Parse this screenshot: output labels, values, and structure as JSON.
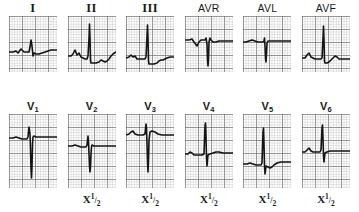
{
  "figure": {
    "grid": {
      "minor_color": "#a8a8a8",
      "major_color": "#5a5a5a",
      "minor_step_px": 2.6,
      "major_every": 5,
      "background": "#ffffff"
    },
    "trace_color": "#141414"
  },
  "rows": [
    {
      "name": "limb-leads",
      "panels": [
        {
          "lead": "I",
          "label_style": "roman",
          "scale": "",
          "box": {
            "w": 48,
            "h": 56
          },
          "baseline": 36,
          "trace": "M0,36 L4,36 L7,35 L9,37 L12,33 L15,36 L17,36 L20,36 L21,31 L22,24 L23,30 L24,40 L25,37 L27,38 L30,38 L33,37 L36,36 L39,35 L42,34 L45,34 L48,34"
        },
        {
          "lead": "II",
          "label_style": "roman",
          "scale": "",
          "box": {
            "w": 48,
            "h": 56
          },
          "baseline": 40,
          "trace": "M0,40 L3,40 L5,38 L7,34 L9,39 L11,37 L13,41 L15,42 L17,43 L19,43 L20,40 L21,22 L21.5,8 L22,22 L22.5,44 L23,47 L25,47 L28,47 L31,46 L33,44 L35,45 L37,46 L39,45 L41,43 L43,40 L45,38 L48,36"
        },
        {
          "lead": "III",
          "label_style": "roman",
          "scale": "",
          "box": {
            "w": 48,
            "h": 56
          },
          "baseline": 42,
          "trace": "M0,42 L3,41 L5,39 L7,41 L9,40 L11,43 L13,43 L15,43 L17,43 L19,43 L20,41 L21,20 L21.5,9 L22,22 L22.5,45 L23,48 L25,48 L28,48 L31,47 L33,45 L35,44 L37,44 L39,43 L41,42 L44,41 L48,41"
        },
        {
          "lead": "AVR",
          "label_style": "avx",
          "scale": "",
          "box": {
            "w": 48,
            "h": 56
          },
          "baseline": 24,
          "trace": "M0,24 L4,24 L7,23 L9,26 L12,30 L14,26 L16,24 L18,24 L20,24 L21,22 L22,28 L22.5,44 L23,50 L23.5,44 L24,26 L25,22 L26,24 L28,26 L31,26 L34,25 L37,25 L40,25 L44,25 L48,25"
        },
        {
          "lead": "AVL",
          "label_style": "avx",
          "scale": "",
          "box": {
            "w": 48,
            "h": 56
          },
          "baseline": 26,
          "trace": "M0,26 L3,26 L6,25 L9,24 L12,25 L15,26 L18,26 L20,26 L21,25 L21.5,22 L22,30 L22.5,42 L23,46 L23.5,38 L24,27 L25,25 L27,25 L30,25 L34,25 L38,25 L42,25 L48,25"
        },
        {
          "lead": "AVF",
          "label_style": "avx",
          "scale": "",
          "box": {
            "w": 48,
            "h": 56
          },
          "baseline": 42,
          "trace": "M0,42 L3,42 L5,39 L7,37 L9,41 L11,42 L13,43 L15,43 L17,43 L19,43 L20,42 L21,22 L21.5,10 L22,24 L22.5,45 L23,47 L25,47 L27,46 L29,44 L31,42 L33,40 L35,41 L37,43 L40,43 L44,43 L48,43"
        }
      ]
    },
    {
      "name": "precordial-leads",
      "panels": [
        {
          "lead": "V",
          "lead_sub": "1",
          "label_style": "vlead",
          "scale": "",
          "box": {
            "w": 48,
            "h": 74
          },
          "baseline": 24,
          "trace": "M0,24 L4,24 L7,23 L10,24 L13,25 L16,25 L18,25 L19,23 L20,13 L21,20 L21.5,35 L22,55 L22.5,64 L23,52 L23.5,30 L24,23 L25,22 L27,23 L30,23 L34,23 L38,23 L42,23 L48,23"
        },
        {
          "lead": "V",
          "lead_sub": "2",
          "label_style": "vlead",
          "scale": "X 1/2",
          "box": {
            "w": 48,
            "h": 74
          },
          "baseline": 32,
          "trace": "M0,32 L4,32 L7,31 L10,32 L13,33 L16,33 L18,33 L19,31 L20,22 L20.5,28 L21,40 L21.5,52 L22,58 L22.5,52 L23,40 L23.5,33 L24,31 L26,32 L29,32 L33,32 L37,32 L42,32 L48,32"
        },
        {
          "lead": "V",
          "lead_sub": "3",
          "label_style": "vlead",
          "scale": "X 1/2",
          "box": {
            "w": 48,
            "h": 74
          },
          "baseline": 20,
          "trace": "M0,21 L3,20 L5,18 L7,17 L9,20 L12,21 L15,21 L17,21 L19,20 L20,10 L20.5,14 L21,30 L21.5,48 L22,58 L22.5,46 L23,26 L24,18 L26,17 L29,18 L32,20 L36,21 L40,21 L44,21 L48,21"
        },
        {
          "lead": "V",
          "lead_sub": "4",
          "label_style": "vlead",
          "scale": "X 1/2",
          "box": {
            "w": 48,
            "h": 74
          },
          "baseline": 40,
          "trace": "M0,40 L3,40 L5,38 L7,39 L9,41 L12,41 L15,41 L17,41 L19,40 L20,12 L20.5,9 L21,22 L21.5,44 L22,52 L22.5,46 L23,41 L25,40 L28,39 L31,38 L34,38 L38,39 L42,39 L48,39"
        },
        {
          "lead": "V",
          "lead_sub": "5",
          "label_style": "vlead",
          "scale": "X 1/2",
          "box": {
            "w": 48,
            "h": 74
          },
          "baseline": 50,
          "trace": "M0,50 L4,50 L7,49 L10,50 L13,51 L16,51 L18,51 L19,49 L20,18 L20.5,14 L21,30 L21.5,52 L22,60 L22.5,56 L23,52 L25,53 L27,54 L29,53 L31,51 L34,49 L38,48 L43,48 L48,48"
        },
        {
          "lead": "V",
          "lead_sub": "6",
          "label_style": "vlead",
          "scale": "X 1/2",
          "box": {
            "w": 48,
            "h": 74
          },
          "baseline": 38,
          "trace": "M0,38 L3,38 L5,36 L7,34 L9,37 L11,38 L14,38 L16,38 L18,38 L19,36 L20,14 L20.5,11 L21,24 L21.5,42 L22,48 L22.5,43 L23,39 L25,38 L28,37 L31,37 L35,37 L39,37 L43,37 L48,37"
        }
      ]
    }
  ],
  "scale_note": {
    "prefix": "X",
    "numerator": "1",
    "denominator": "2"
  }
}
